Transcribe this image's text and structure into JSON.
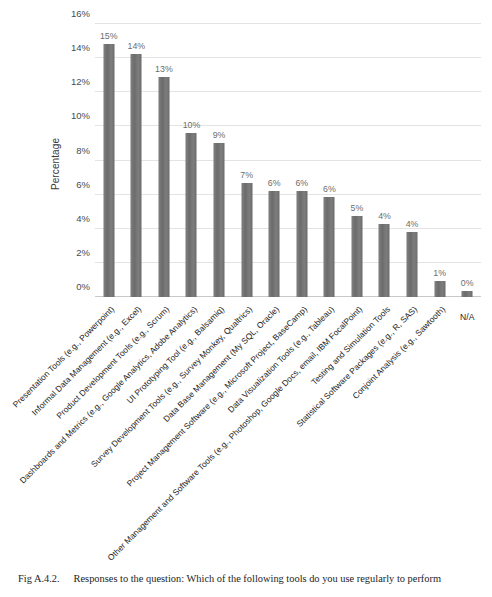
{
  "figure": {
    "caption_number": "Fig A.4.2.",
    "caption_text": "Responses to the question: Which of the following tools do you use regularly to perform"
  },
  "chart_data": {
    "type": "bar",
    "title": "",
    "xlabel": "",
    "ylabel": "Percentage",
    "ylim": [
      0,
      16
    ],
    "yticks": [
      "0%",
      "2%",
      "4%",
      "6%",
      "8%",
      "10%",
      "12%",
      "14%",
      "16%"
    ],
    "ytick_values": [
      0,
      2,
      4,
      6,
      8,
      10,
      12,
      14,
      16
    ],
    "grid": true,
    "legend": "none",
    "bar_color": "#727272",
    "categories": [
      "Presentation Tools (e.g., Powerpoint)",
      "Informal Data Management (e.g., Excel)",
      "Product Development Tools (e.g., Scrum)",
      "Dashboards and Metrics (e.g., Google Analytics, Adobe Analytics)",
      "UI Prototyping Tool (e.g., Balsamiq)",
      "Survey Development Tools (e.g., Survey Monkey, Qualtrics)",
      "Data Base Management (My SQL, Oracle)",
      "Project Management Software (e.g., Microsoft Project, BaseCamp)",
      "Data Visualization Tools (e.g., Tableau)",
      "Other Management and Software Tools (e.g., Photoshop, Google Docs, email, IBM FocalPoint)",
      "Testing and Simulation Tools",
      "Statistical Software Packages (e.g., R, SAS)",
      "Conjoint Analysis (e.g., Sawtooth)",
      "N/A"
    ],
    "values": [
      15,
      14,
      13,
      10,
      9,
      7,
      6,
      6,
      6,
      5,
      4,
      4,
      1,
      0
    ],
    "data_labels": [
      "15%",
      "14%",
      "13%",
      "10%",
      "9%",
      "7%",
      "6%",
      "6%",
      "6%",
      "5%",
      "4%",
      "4%",
      "1%",
      "0%"
    ],
    "bar_pixel_values": [
      14.85,
      14.25,
      12.9,
      9.6,
      9.05,
      6.7,
      6.2,
      6.2,
      5.85,
      4.75,
      4.3,
      3.8,
      0.95,
      0.35
    ]
  }
}
